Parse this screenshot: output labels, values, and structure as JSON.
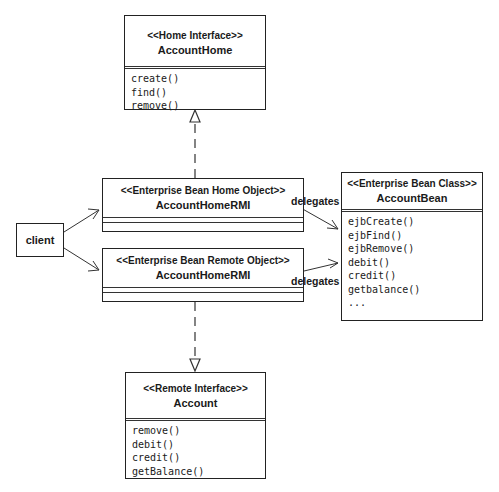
{
  "diagram": {
    "type": "UML class diagram",
    "classes": {
      "home_interface": {
        "stereotype": "<<Home Interface>>",
        "name": "AccountHome",
        "operations": [
          "create()",
          "find()",
          "remove()"
        ]
      },
      "home_object": {
        "stereotype": "<<Enterprise Bean Home Object>>",
        "name": "AccountHomeRMI",
        "operations": []
      },
      "remote_object": {
        "stereotype": "<<Enterprise Bean Remote Object>>",
        "name": "AccountHomeRMI",
        "operations": []
      },
      "bean_class": {
        "stereotype": "<<Enterprise Bean Class>>",
        "name": "AccountBean",
        "operations": [
          "ejbCreate()",
          "ejbFind()",
          "ejbRemove()",
          "debit()",
          "credit()",
          "getbalance()",
          "..."
        ]
      },
      "remote_interface": {
        "stereotype": "<<Remote Interface>>",
        "name": "Account",
        "operations": [
          "remove()",
          "debit()",
          "credit()",
          "getBalance()"
        ]
      }
    },
    "client": {
      "label": "client"
    },
    "edges": [
      {
        "from": "client",
        "to": "home_object",
        "kind": "association-arrow"
      },
      {
        "from": "client",
        "to": "remote_object",
        "kind": "association-arrow"
      },
      {
        "from": "home_object",
        "to": "home_interface",
        "kind": "realization"
      },
      {
        "from": "remote_object",
        "to": "remote_interface",
        "kind": "realization"
      },
      {
        "from": "home_object",
        "to": "bean_class",
        "kind": "dependency",
        "label": "delegates"
      },
      {
        "from": "remote_object",
        "to": "bean_class",
        "kind": "dependency",
        "label": "delegates"
      }
    ],
    "labels": {
      "delegates_top": "delegates",
      "delegates_bottom": "delegates"
    }
  }
}
